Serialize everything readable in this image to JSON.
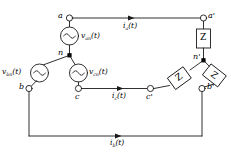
{
  "diagram": {
    "stroke_color": "#1a1a1a",
    "fill_node_color": "#000000",
    "background": "#ffffff"
  },
  "source": {
    "type": "wye-connected-voltage-source",
    "neutral_label": "n",
    "terminals": [
      {
        "name": "a",
        "label": "a"
      },
      {
        "name": "b",
        "label": "b"
      },
      {
        "name": "c",
        "label": "c"
      }
    ],
    "sources": [
      {
        "name": "van",
        "base": "v",
        "sub": "an",
        "arg": "(t)",
        "full": "van(t)"
      },
      {
        "name": "vbn",
        "base": "v",
        "sub": "bn",
        "arg": "(t)",
        "full": "vbn(t)"
      },
      {
        "name": "vcn",
        "base": "v",
        "sub": "cn",
        "arg": "(t)",
        "full": "vcn(t)"
      }
    ]
  },
  "load": {
    "type": "wye-connected-impedance-load",
    "neutral_label": "n'",
    "terminals": [
      {
        "name": "a-prime",
        "label": "a'"
      },
      {
        "name": "b-prime",
        "label": "b'"
      },
      {
        "name": "c-prime",
        "label": "c'"
      }
    ],
    "impedances": [
      {
        "name": "z-phase-a",
        "label": "Z"
      },
      {
        "name": "z-phase-c",
        "label": "Z"
      },
      {
        "name": "z-phase-b",
        "label": "Z"
      }
    ]
  },
  "currents": [
    {
      "name": "ia",
      "base": "i",
      "sub": "a",
      "arg": "(t)",
      "full": "ia(t)",
      "line": "top"
    },
    {
      "name": "ic",
      "base": "i",
      "sub": "c",
      "arg": "(t)",
      "full": "ic(t)",
      "line": "middle"
    },
    {
      "name": "ib",
      "base": "i",
      "sub": "b",
      "arg": "(t)",
      "full": "ib(t)",
      "line": "bottom"
    }
  ]
}
